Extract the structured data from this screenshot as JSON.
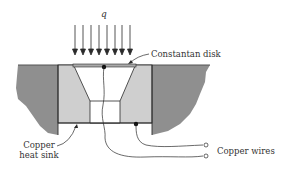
{
  "diagram": {
    "labels": {
      "heat_flux": "q",
      "constantan_disk": "Constantan disk",
      "copper_heat_sink_line1": "Copper",
      "copper_heat_sink_line2": "heat sink",
      "copper_wires": "Copper wires"
    },
    "arrow_count": 8,
    "colors": {
      "body_dark": "#8f8f8f",
      "heat_sink": "#cfcfcf",
      "line": "#2a2a2a",
      "text": "#333333",
      "background": "#ffffff"
    }
  }
}
